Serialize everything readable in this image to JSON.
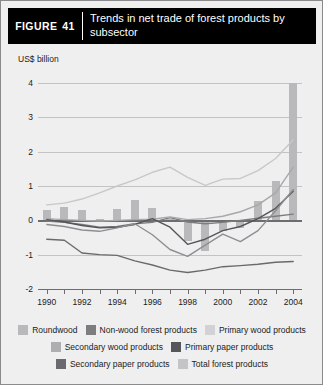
{
  "figure": {
    "tag_word": "FIGURE",
    "number": "41",
    "title": "Trends in net trade of forest products by subsector"
  },
  "chart_data": {
    "type": "bar",
    "title": "Trends in net trade of forest products by subsector",
    "xlabel": "",
    "ylabel": "US$ billion",
    "ylim": [
      -2,
      4
    ],
    "xlim": [
      1990,
      2004
    ],
    "grid": true,
    "legend_position": "bottom",
    "yticks": [
      "4",
      "3",
      "2",
      "1",
      "0",
      "-1",
      "-2"
    ],
    "ytick_values": [
      4,
      3,
      2,
      1,
      0,
      -1,
      -2
    ],
    "x": [
      1990,
      1991,
      1992,
      1993,
      1994,
      1995,
      1996,
      1997,
      1998,
      1999,
      2000,
      2001,
      2002,
      2003,
      2004
    ],
    "xticks": [
      "1990",
      "1992",
      "1994",
      "1996",
      "1998",
      "2000",
      "2002",
      "2004"
    ],
    "xtick_values": [
      1990,
      1992,
      1994,
      1996,
      1998,
      2000,
      2002,
      2004
    ],
    "series": [
      {
        "name": "Roundwood",
        "render": "bar",
        "color": "#b9b9bb",
        "values": [
          0.3,
          0.38,
          0.3,
          0.05,
          0.33,
          0.6,
          0.36,
          0.05,
          -0.6,
          -0.9,
          -0.3,
          -0.22,
          0.55,
          1.15,
          4.0
        ]
      },
      {
        "name": "Non-wood forest products",
        "render": "line",
        "color": "#7d7d7f",
        "values": [
          -0.02,
          -0.06,
          -0.12,
          -0.2,
          -0.18,
          -0.1,
          -0.06,
          0.08,
          -0.05,
          -0.1,
          -0.06,
          0.0,
          0.06,
          0.12,
          0.18
        ]
      },
      {
        "name": "Primary wood products",
        "render": "line",
        "color": "#c8c8ca",
        "values": [
          0.45,
          0.5,
          0.62,
          0.8,
          1.0,
          1.18,
          1.4,
          1.55,
          1.25,
          1.02,
          1.2,
          1.22,
          1.45,
          1.8,
          2.35
        ]
      },
      {
        "name": "Secondary wood products",
        "render": "line",
        "color": "#a8a8aa",
        "values": [
          0.05,
          0.02,
          0.0,
          -0.02,
          0.0,
          0.02,
          0.03,
          0.1,
          0.02,
          0.05,
          0.12,
          0.25,
          0.45,
          0.8,
          1.55
        ]
      },
      {
        "name": "Primary paper products",
        "render": "line",
        "color": "#55555a",
        "values": [
          0.02,
          -0.05,
          -0.15,
          -0.22,
          -0.2,
          -0.12,
          0.05,
          -0.2,
          -0.7,
          -0.55,
          -0.3,
          -0.18,
          0.05,
          0.35,
          0.85
        ]
      },
      {
        "name": "Secondary paper products",
        "render": "line",
        "color": "#6a6a6e",
        "values": [
          -0.55,
          -0.58,
          -0.95,
          -1.0,
          -1.02,
          -1.18,
          -1.3,
          -1.45,
          -1.52,
          -1.45,
          -1.35,
          -1.32,
          -1.28,
          -1.22,
          -1.2
        ]
      },
      {
        "name": "Total forest products",
        "render": "line",
        "color": "#8e8e92",
        "values": [
          -0.12,
          -0.18,
          -0.28,
          -0.32,
          -0.22,
          -0.1,
          -0.42,
          -0.85,
          -1.05,
          -0.72,
          -0.4,
          -0.62,
          -0.3,
          0.28,
          0.9
        ]
      }
    ]
  },
  "legend": {
    "rows": [
      [
        {
          "label": "Roundwood",
          "color": "#b9b9bb"
        },
        {
          "label": "Non-wood forest products",
          "color": "#7d7d7f"
        },
        {
          "label": "Primary wood products",
          "color": "#d2d2d4"
        }
      ],
      [
        {
          "label": "Secondary wood products",
          "color": "#aeaeb0"
        },
        {
          "label": "Primary paper products",
          "color": "#55555a"
        }
      ],
      [
        {
          "label": "Secondary paper products",
          "color": "#6a6a6e"
        },
        {
          "label": "Total forest products",
          "color": "#c4c4c6"
        }
      ]
    ]
  }
}
